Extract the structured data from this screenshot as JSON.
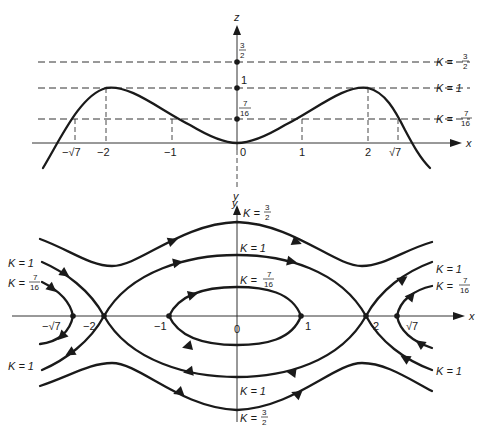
{
  "top_plot": {
    "z_axis_label": "z",
    "x_axis_label": "x",
    "y_axis_label": "y",
    "origin_label": "0",
    "x_ticks": [
      {
        "label": "−√7",
        "value": -2.6458
      },
      {
        "label": "−2",
        "value": -2
      },
      {
        "label": "−1",
        "value": -1
      },
      {
        "label": "1",
        "value": 1
      },
      {
        "label": "2",
        "value": 2
      },
      {
        "label": "√7",
        "value": 2.6458
      }
    ],
    "z_ticks": [
      {
        "num": "7",
        "den": "16",
        "value": 0.4375
      },
      {
        "label": "1",
        "value": 1
      },
      {
        "num": "3",
        "den": "2",
        "value": 1.5
      }
    ],
    "levels": [
      {
        "K": "K =",
        "num": "3",
        "den": "2",
        "value": 1.5
      },
      {
        "K": "K = 1",
        "value": 1
      },
      {
        "K": "K =",
        "num": "7",
        "den": "16",
        "value": 0.4375
      }
    ]
  },
  "bottom_plot": {
    "y_axis_label": "y",
    "x_axis_label": "x",
    "origin_label": "0",
    "x_ticks": [
      {
        "label": "−√7",
        "value": -2.6458
      },
      {
        "label": "−2",
        "value": -2
      },
      {
        "label": "−1",
        "value": -1
      },
      {
        "label": "1",
        "value": 1
      },
      {
        "label": "2",
        "value": 2
      },
      {
        "label": "√7",
        "value": 2.6458
      }
    ],
    "center_labels": {
      "top_3_2": {
        "K": "K =",
        "num": "3",
        "den": "2"
      },
      "top_1": "K = 1",
      "top_7_16": {
        "K": "K =",
        "num": "7",
        "den": "16"
      },
      "bottom_1": "K = 1",
      "bottom_3_2": {
        "K": "K =",
        "num": "3",
        "den": "2"
      }
    },
    "left_labels": {
      "upper_1": "K = 1",
      "upper_7_16": {
        "K": "K =",
        "num": "7",
        "den": "16"
      },
      "lower_1": "K = 1"
    },
    "right_labels": {
      "upper_1": "K = 1",
      "upper_7_16": {
        "K": "K =",
        "num": "7",
        "den": "16"
      },
      "lower_1": "K = 1"
    }
  }
}
